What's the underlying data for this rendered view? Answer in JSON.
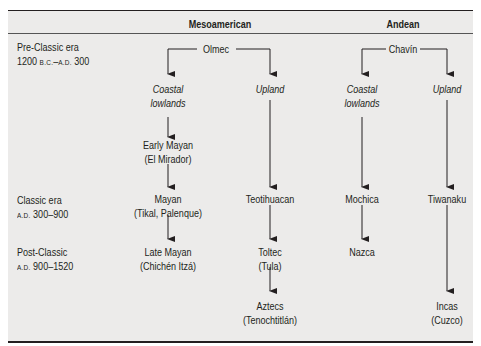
{
  "header": {
    "col_meso": "Mesoamerican",
    "col_andean": "Andean"
  },
  "eras": [
    {
      "name": "Pre-Classic era",
      "range_prefix": "1200 ",
      "range_era1": "B.C.",
      "range_mid": "–",
      "range_era2": "A.D.",
      "range_suffix": " 300"
    },
    {
      "name": "Classic era",
      "range_era1": "A.D.",
      "range_suffix": " 300–900"
    },
    {
      "name": "Post-Classic",
      "range_era1": "A.D.",
      "range_suffix": " 900–1520"
    }
  ],
  "meso": {
    "root": "Olmec",
    "coastal": {
      "line1": "Coastal",
      "line2": "lowlands"
    },
    "upland": "Upland",
    "early_mayan": {
      "line1": "Early Mayan",
      "line2": "(El Mirador)"
    },
    "mayan": {
      "line1": "Mayan",
      "line2": "(Tikal, Palenque)"
    },
    "late_mayan": {
      "line1": "Late Mayan",
      "line2": "(Chichén Itzá)"
    },
    "teotihuacan": "Teotihuacan",
    "toltec": {
      "line1": "Toltec",
      "line2": "(Tula)"
    },
    "aztecs": {
      "line1": "Aztecs",
      "line2": "(Tenochtitlán)"
    }
  },
  "andean": {
    "root": "Chavín",
    "coastal": {
      "line1": "Coastal",
      "line2": "lowlands"
    },
    "upland": "Upland",
    "mochica": "Mochica",
    "nazca": "Nazca",
    "tiwanaku": "Tiwanaku",
    "incas": {
      "line1": "Incas",
      "line2": "(Cuzco)"
    }
  }
}
